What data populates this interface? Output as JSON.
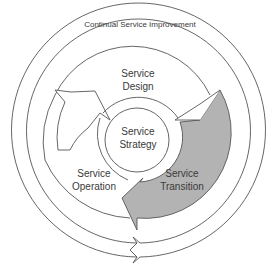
{
  "diagram": {
    "type": "itil-service-lifecycle",
    "outer_ring": {
      "label": "Continual Service Improvement"
    },
    "cycle": {
      "stages": [
        {
          "id": "design",
          "line1": "Service",
          "line2": "Design"
        },
        {
          "id": "transition",
          "line1": "Service",
          "line2": "Transition",
          "highlighted": true
        },
        {
          "id": "operation",
          "line1": "Service",
          "line2": "Operation"
        }
      ]
    },
    "core": {
      "line1": "Service",
      "line2": "Strategy"
    },
    "colors": {
      "stroke": "#555555",
      "highlight_fill": "#b3b3b3",
      "background": "#ffffff"
    }
  }
}
